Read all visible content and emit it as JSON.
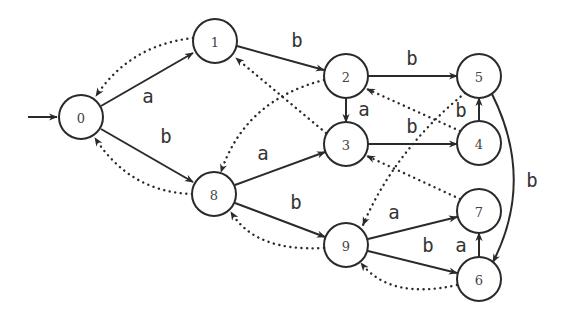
{
  "diagram": {
    "type": "automaton",
    "start_state": "0",
    "colors": {
      "stroke": "#2a2a2a",
      "background": "#ffffff",
      "text": "#333333"
    },
    "nodes": [
      {
        "id": "0",
        "label": "0",
        "x": 81,
        "y": 117
      },
      {
        "id": "1",
        "label": "1",
        "x": 215,
        "y": 41
      },
      {
        "id": "2",
        "label": "2",
        "x": 346,
        "y": 76
      },
      {
        "id": "3",
        "label": "3",
        "x": 346,
        "y": 144
      },
      {
        "id": "4",
        "label": "4",
        "x": 479,
        "y": 143
      },
      {
        "id": "5",
        "label": "5",
        "x": 479,
        "y": 76
      },
      {
        "id": "6",
        "label": "6",
        "x": 479,
        "y": 279
      },
      {
        "id": "7",
        "label": "7",
        "x": 479,
        "y": 211
      },
      {
        "id": "8",
        "label": "8",
        "x": 214,
        "y": 194
      },
      {
        "id": "9",
        "label": "9",
        "x": 346,
        "y": 245
      }
    ],
    "transitions": [
      {
        "from": "0",
        "to": "1",
        "label": "a"
      },
      {
        "from": "0",
        "to": "8",
        "label": "b"
      },
      {
        "from": "1",
        "to": "2",
        "label": "b"
      },
      {
        "from": "2",
        "to": "5",
        "label": "b"
      },
      {
        "from": "2",
        "to": "3",
        "label": "a"
      },
      {
        "from": "3",
        "to": "4",
        "label": "b"
      },
      {
        "from": "4",
        "to": "5",
        "label": "b"
      },
      {
        "from": "5",
        "to": "6",
        "label": "b"
      },
      {
        "from": "8",
        "to": "3",
        "label": "a"
      },
      {
        "from": "8",
        "to": "9",
        "label": "b"
      },
      {
        "from": "9",
        "to": "7",
        "label": "a"
      },
      {
        "from": "9",
        "to": "6",
        "label": "b"
      },
      {
        "from": "6",
        "to": "7",
        "label": "a"
      }
    ],
    "failure_links": [
      {
        "from": "1",
        "to": "0"
      },
      {
        "from": "8",
        "to": "0"
      },
      {
        "from": "2",
        "to": "8"
      },
      {
        "from": "3",
        "to": "1"
      },
      {
        "from": "4",
        "to": "2"
      },
      {
        "from": "5",
        "to": "9"
      },
      {
        "from": "7",
        "to": "3"
      },
      {
        "from": "9",
        "to": "8"
      },
      {
        "from": "6",
        "to": "9"
      }
    ]
  }
}
